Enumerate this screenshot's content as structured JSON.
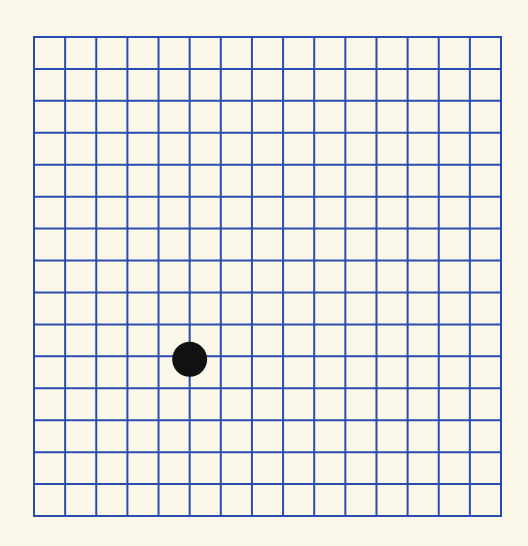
{
  "diagram": {
    "type": "amsler-grid",
    "title": "Amsler grid",
    "grid": {
      "columns": 15,
      "rows": 15,
      "left": 34,
      "top": 37,
      "right": 501,
      "bottom": 516,
      "line_color": "#2a4bb0",
      "line_width": 2
    },
    "fixation_dot": {
      "grid_col": 5,
      "grid_row": 10,
      "diameter": 35,
      "color": "#111111"
    },
    "background_color": "#fbf8ea"
  }
}
